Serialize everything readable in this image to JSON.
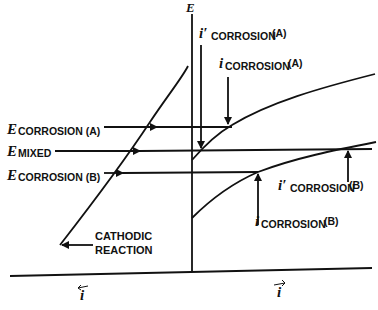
{
  "diagram": {
    "type": "Evans diagram (mixed potential theory)",
    "axes": {
      "y_label": "E",
      "x_left_label": "i",
      "x_right_label": "i"
    },
    "labels": {
      "e_corr_a": {
        "main": "E",
        "sub": "CORROSION (A)"
      },
      "e_mixed": {
        "main": "E",
        "sub": "MIXED"
      },
      "e_corr_b": {
        "main": "E",
        "sub": "CORROSION (B)"
      },
      "i_prime_corr_a": {
        "main": "i′",
        "sub": "CORROSION",
        "suffix": "(A)"
      },
      "i_corr_a": {
        "main": "i",
        "sub": "CORROSION",
        "suffix": "(A)"
      },
      "i_prime_corr_b": {
        "main": "i′",
        "sub": "CORROSION",
        "suffix": "(B)"
      },
      "i_corr_b": {
        "main": "i",
        "sub": "CORROSION",
        "suffix": "(B)"
      },
      "cathodic_line1": "CATHODIC",
      "cathodic_line2": "REACTION"
    },
    "colors": {
      "ink": "#111111",
      "background": "#ffffff"
    }
  }
}
